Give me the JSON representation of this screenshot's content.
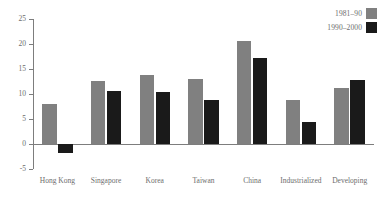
{
  "chart_data": {
    "type": "bar",
    "title": "",
    "subtitle": "",
    "xlabel": "",
    "ylabel": "",
    "ylim": [
      -5,
      25
    ],
    "yticks": [
      -5,
      0,
      5,
      10,
      15,
      20,
      25
    ],
    "ytick_labels": [
      "-5",
      "0",
      "5",
      "10",
      "15",
      "20",
      "25"
    ],
    "grid": false,
    "legend_position": "top-right",
    "categories": [
      "Hong Kong",
      "Singapore",
      "Korea",
      "Taiwan",
      "China",
      "Industrialized",
      "Developing"
    ],
    "series": [
      {
        "name": "1981–90",
        "color": "#808080",
        "values": [
          8.0,
          12.6,
          13.8,
          13.0,
          20.6,
          8.8,
          11.2
        ]
      },
      {
        "name": "1990–2000",
        "color": "#1a1a1a",
        "values": [
          -1.8,
          10.6,
          10.4,
          8.8,
          17.2,
          4.4,
          12.8
        ]
      }
    ]
  },
  "axis": {
    "tick_color": "#7d7d7d",
    "label_color": "#6d6d6d"
  }
}
